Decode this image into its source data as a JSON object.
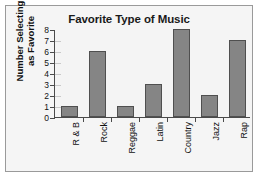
{
  "chart_data": {
    "type": "bar",
    "title": "Favorite Type of Music",
    "xlabel": "",
    "ylabel": "Number Selecting as Favorite",
    "ylabel_line1": "Number Selecting",
    "ylabel_line2": "as Favorite",
    "categories": [
      "R & B",
      "Rock",
      "Reggae",
      "Latin",
      "Country",
      "Jazz",
      "Rap"
    ],
    "values": [
      1,
      6,
      1,
      3,
      8,
      2,
      7
    ],
    "ylim": [
      0,
      8
    ],
    "ytick_labels": [
      "0",
      "1",
      "2",
      "3",
      "4",
      "5",
      "6",
      "7",
      "8"
    ],
    "ytick_values": [
      0,
      1,
      2,
      3,
      4,
      5,
      6,
      7,
      8
    ],
    "grid": false,
    "legend": "none",
    "bar_color": "#858585",
    "bar_edge_color": "#4f4f4f",
    "axis_color": "#4a4a4a",
    "text_color": "#111111",
    "plot_background": "#f4f4f4",
    "figure_background": "#f5f5f5",
    "frame_border_color": "#9a9a9a"
  }
}
